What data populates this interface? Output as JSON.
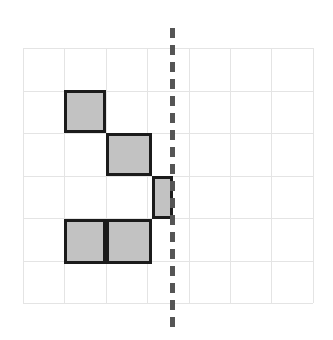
{
  "figure": {
    "canvas": {
      "width": 333,
      "height": 340,
      "background": "#ffffff"
    }
  },
  "grid": {
    "name": "square-grid",
    "columns": 7,
    "rows": 6,
    "origin_x": 23,
    "origin_y": 48,
    "cell_width": 41.4,
    "cell_height": 42.5,
    "line_color": "#e4e4e4",
    "line_width": 1,
    "visible": true
  },
  "mirror_line": {
    "name": "line-of-symmetry",
    "orientation": "vertical",
    "x": 170,
    "top": 28,
    "bottom": 328,
    "color": "#555555",
    "width": 5,
    "dash_length": 10,
    "gap_length": 7,
    "style": "dashed",
    "grid_column_index": 3.55
  },
  "shape": {
    "name": "shaded-shape",
    "fill_color": "#c2c2c2",
    "stroke_color": "#1b1b1b",
    "stroke_width": 3,
    "cell_count": 5,
    "cells": [
      {
        "id": "cell-a",
        "col": 1,
        "row": 1,
        "x": 64,
        "y": 90,
        "width": 42,
        "height": 43,
        "full_cell": true,
        "label": "top square"
      },
      {
        "id": "cell-b",
        "col": 2,
        "row": 2,
        "x": 106,
        "y": 133,
        "width": 46,
        "height": 43,
        "full_cell": true,
        "label": "second step square"
      },
      {
        "id": "cell-c",
        "col": 3,
        "row": 3,
        "x": 152,
        "y": 176,
        "width": 21,
        "height": 43,
        "full_cell": false,
        "label": "half square touching mirror line"
      },
      {
        "id": "cell-d",
        "col": 1,
        "row": 4,
        "x": 64,
        "y": 219,
        "width": 42,
        "height": 45,
        "full_cell": true,
        "label": "bottom left square"
      },
      {
        "id": "cell-e",
        "col": 2,
        "row": 4,
        "x": 106,
        "y": 219,
        "width": 46,
        "height": 45,
        "full_cell": true,
        "label": "bottom right square"
      }
    ]
  }
}
